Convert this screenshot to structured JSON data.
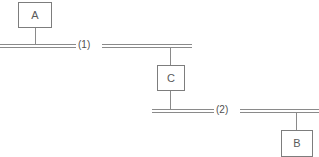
{
  "diagram": {
    "type": "single-line-connection-diagram",
    "background_color": "#ffffff",
    "stroke_color": "#8a8a8a",
    "text_color": "#4f4f4f",
    "width": 319,
    "height": 157,
    "nodes": [
      {
        "id": "A",
        "label": "A",
        "x": 18,
        "y": 2,
        "w": 34,
        "h": 26
      },
      {
        "id": "C",
        "label": "C",
        "x": 157,
        "y": 65,
        "w": 28,
        "h": 26
      },
      {
        "id": "B",
        "label": "B",
        "x": 281,
        "y": 130,
        "w": 32,
        "h": 27
      }
    ],
    "buses": [
      {
        "id": "bus-1",
        "label": "(1)",
        "y": 44,
        "label_x": 78,
        "label_y": 40,
        "segments": [
          {
            "x": 0,
            "w": 76
          },
          {
            "x": 102,
            "w": 90
          }
        ]
      },
      {
        "id": "bus-2",
        "label": "(2)",
        "y": 109,
        "label_x": 216,
        "label_y": 105,
        "segments": [
          {
            "x": 152,
            "w": 62
          },
          {
            "x": 240,
            "w": 79
          }
        ]
      }
    ],
    "connectors": [
      {
        "id": "stem-a-to-bus1",
        "x": 35,
        "y": 28,
        "h": 18
      },
      {
        "id": "stem-bus1-to-c",
        "x": 170,
        "y": 46,
        "h": 20
      },
      {
        "id": "stem-c-to-bus2",
        "x": 170,
        "y": 91,
        "h": 20
      },
      {
        "id": "stem-bus2-to-b",
        "x": 296,
        "y": 111,
        "h": 20
      }
    ]
  }
}
